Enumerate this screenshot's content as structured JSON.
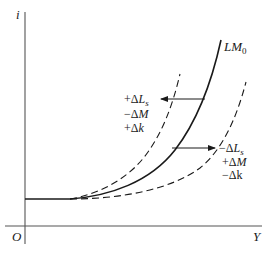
{
  "diagram": {
    "type": "economics-lm-curve-shift",
    "axes": {
      "y_label": "i",
      "x_label": "Y",
      "origin_label": "O"
    },
    "curves": {
      "base": {
        "name": "LM",
        "subscript": "0",
        "style": "solid"
      },
      "left_shift": {
        "style": "dashed",
        "direction": "left"
      },
      "right_shift": {
        "style": "dashed",
        "direction": "right"
      }
    },
    "shift_labels": {
      "left": [
        {
          "sign": "+",
          "symbol": "Δ",
          "var": "L",
          "sub": "s"
        },
        {
          "sign": "−",
          "symbol": "Δ",
          "var": "M",
          "sub": ""
        },
        {
          "sign": "+",
          "symbol": "Δ",
          "var": "k",
          "sub": ""
        }
      ],
      "right": [
        {
          "sign": "−",
          "symbol": "Δ",
          "var": "L",
          "sub": "s"
        },
        {
          "sign": "+",
          "symbol": "Δ",
          "var": "M",
          "sub": ""
        },
        {
          "sign": "−",
          "symbol": "Δ",
          "var": "k",
          "sub": ""
        }
      ]
    },
    "colors": {
      "ink": "#1a1a1a",
      "axis": "#555555",
      "background": "#ffffff"
    }
  }
}
